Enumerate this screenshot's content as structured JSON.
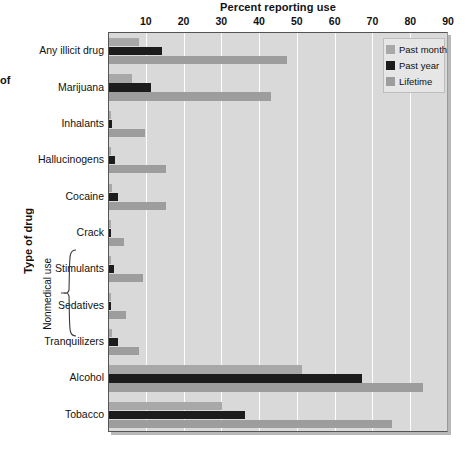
{
  "figure": {
    "title": "Percent reporting use",
    "yaxis_title": "Type of drug",
    "group_label": "Nonmedical use",
    "caption_fragment": "of"
  },
  "legend": {
    "position": "top-right",
    "items": [
      {
        "label": "Past month",
        "color": "#a8a8a8",
        "key": "past_month"
      },
      {
        "label": "Past year",
        "color": "#1c1c1c",
        "key": "past_year"
      },
      {
        "label": "Lifetime",
        "color": "#9d9d9d",
        "key": "lifetime"
      }
    ]
  },
  "chart_data": {
    "type": "bar",
    "orientation": "horizontal",
    "title": "Percent reporting use",
    "xlabel": "Percent reporting use",
    "ylabel": "Type of drug",
    "xlim": [
      0,
      90
    ],
    "xticks": [
      10,
      20,
      30,
      40,
      50,
      60,
      70,
      80,
      90
    ],
    "xtick_labels": [
      "10",
      "20",
      "30",
      "40",
      "50",
      "60",
      "70",
      "80",
      "90"
    ],
    "grid": true,
    "grid_axis": "x",
    "legend_position": "top-right",
    "categories": [
      "Any illicit drug",
      "Marijuana",
      "Inhalants",
      "Hallucinogens",
      "Cocaine",
      "Crack",
      "Stimulants",
      "Sedatives",
      "Tranquilizers",
      "Alcohol",
      "Tobacco"
    ],
    "group_bracket": {
      "label": "Nonmedical use",
      "categories": [
        "Stimulants",
        "Sedatives",
        "Tranquilizers"
      ]
    },
    "series": [
      {
        "name": "Past month",
        "color": "#a8a8a8",
        "values": [
          8.0,
          6.0,
          0.3,
          0.6,
          0.9,
          0.3,
          0.6,
          0.3,
          0.9,
          51.0,
          30.0
        ]
      },
      {
        "name": "Past year",
        "color": "#1c1c1c",
        "values": [
          14.0,
          11.0,
          0.9,
          1.6,
          2.5,
          0.6,
          1.4,
          0.5,
          2.4,
          67.0,
          36.0
        ]
      },
      {
        "name": "Lifetime",
        "color": "#9d9d9d",
        "values": [
          47.0,
          43.0,
          9.5,
          15.0,
          15.0,
          4.0,
          9.0,
          4.5,
          8.0,
          83.0,
          75.0
        ]
      }
    ]
  }
}
